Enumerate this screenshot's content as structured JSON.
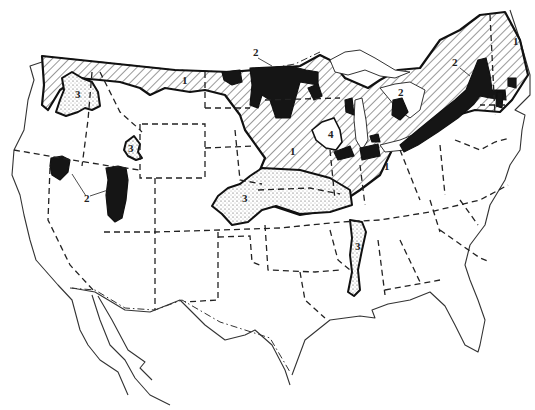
{
  "map": {
    "subject": "Contiguous United States",
    "style": "monochrome line map",
    "legend_patterns": {
      "1": "diagonal hatching",
      "2": "solid black",
      "3": "stippled dots",
      "4": "clear outlined area"
    },
    "labels": [
      {
        "id": "label-1-montana",
        "text": "1",
        "x": 182,
        "y": 84
      },
      {
        "id": "label-1-minnesota",
        "text": "1",
        "x": 290,
        "y": 155
      },
      {
        "id": "label-1-ohio",
        "text": "1",
        "x": 384,
        "y": 170
      },
      {
        "id": "label-1-maine",
        "text": "1",
        "x": 513,
        "y": 45
      },
      {
        "id": "label-2-canada-border",
        "text": "2",
        "x": 255,
        "y": 56
      },
      {
        "id": "label-2-ontario",
        "text": "2",
        "x": 398,
        "y": 96
      },
      {
        "id": "label-2-quebec",
        "text": "2",
        "x": 455,
        "y": 65
      },
      {
        "id": "label-2-nevada",
        "text": "2",
        "x": 85,
        "y": 199
      },
      {
        "id": "label-3-idaho",
        "text": "3",
        "x": 76,
        "y": 95
      },
      {
        "id": "label-3-wyoming",
        "text": "3",
        "x": 130,
        "y": 150
      },
      {
        "id": "label-3-kansas",
        "text": "3",
        "x": 245,
        "y": 200
      },
      {
        "id": "label-3-mississippi",
        "text": "3",
        "x": 364,
        "y": 250
      },
      {
        "id": "label-4-wisconsin",
        "text": "4",
        "x": 330,
        "y": 140
      }
    ]
  }
}
